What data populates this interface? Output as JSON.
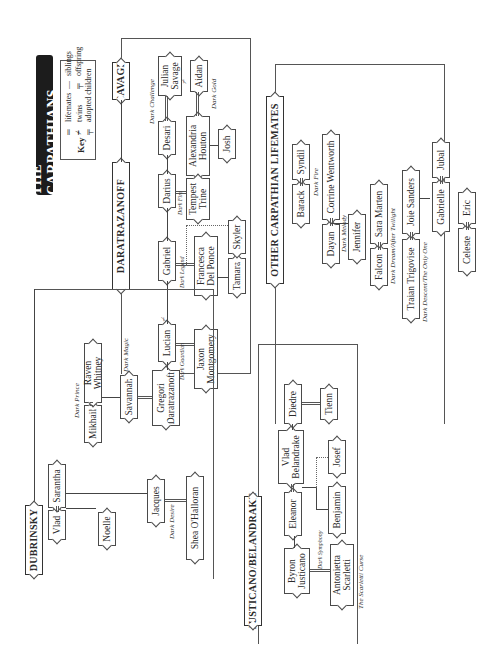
{
  "title": "THE CARPATHIANS",
  "key": {
    "label": "Key",
    "items": [
      {
        "symbol": "double-line",
        "label": "lifemates"
      },
      {
        "symbol": "twins-mark",
        "label": "twins"
      },
      {
        "symbol": "dotted-offspring",
        "label": "adopted children"
      },
      {
        "symbol": "single-line",
        "label": "siblings"
      },
      {
        "symbol": "offspring-tee",
        "label": "offspring"
      }
    ]
  },
  "families": {
    "savage": "SAVAGE",
    "daratrazanoff": "DARATRAZANOFF",
    "dubrinsky": "DUBRINSKY",
    "justicano": "JUSTICANO/BELANDRAKE",
    "other": "OTHER CARPATHIAN LIFEMATES"
  },
  "people": {
    "julian": "Julian Savage",
    "aidan": "Aidan",
    "desari": "Desari",
    "alexandria": "Alexandria Houton",
    "josh": "Josh",
    "darius": "Darius",
    "tempest": "Tempest Trine",
    "gabriel": "Gabriel",
    "francesca": "Francesca Del Ponce",
    "tamara": "Tamara",
    "skyler": "Skyler",
    "lucian": "Lucian",
    "jaxon": "Jaxon Montgomery",
    "gregori": "Gregori Daratrazanoff",
    "savannah": "Savannah",
    "mikhail": "Mikhail",
    "raven": "Raven Whitney",
    "vlad": "Vlad",
    "sarantha": "Sarantha",
    "noelle": "Noelle",
    "jacques": "Jacques",
    "shea": "Shea O'Halloran",
    "byron": "Byron Justicano",
    "antonietta": "Antonietta Scarletti",
    "eleanor": "Eleanor",
    "vladb": "Vlad Belandrake",
    "benjamin": "Benjamin",
    "josef": "Josef",
    "diedre": "Diedre",
    "tienn": "Tienn",
    "barack": "Barack",
    "syndil": "Syndil",
    "dayan": "Dayan",
    "corrine": "Corrine Wentworth",
    "jennifer": "Jennifer",
    "falcon": "Falcon",
    "sara": "Sara Marten",
    "traian": "Traian Trigovise",
    "joie": "Joie Sanders",
    "gabrielle": "Gabrielle",
    "jubal": "Jubal",
    "celeste": "Celeste",
    "eric": "Eric"
  },
  "books": {
    "dark_challenge": "Dark Challenge",
    "dark_gold": "Dark Gold",
    "dark_fire_darius": "Dark Fire",
    "dark_legend": "Dark Legend",
    "dark_guardian": "Dark Guardian",
    "dark_magic": "Dark Magic",
    "dark_prince": "Dark Prince",
    "dark_desire": "Dark Desire",
    "dark_symphony": "Dark Symphony",
    "scarletti_curse": "The Scarletti Curse",
    "dark_fire_barack": "Dark Fire",
    "dark_melody": "Dark Melody",
    "dark_dream": "Dark Dream/After Twilight",
    "dark_descent": "Dark Descent/The Only One"
  }
}
